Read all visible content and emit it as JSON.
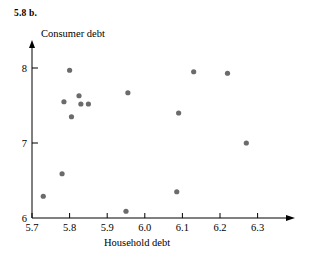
{
  "figure": {
    "exercise_label": "5.8  b.",
    "y_axis_title": "Consumer debt",
    "x_axis_title": "Household debt"
  },
  "chart_data": {
    "type": "scatter",
    "title": "",
    "xlabel": "Household debt",
    "ylabel": "Consumer debt",
    "xlim": [
      5.7,
      6.35
    ],
    "ylim": [
      6.0,
      8.1
    ],
    "xticks": [
      "5.7",
      "5.8",
      "5.9",
      "6.0",
      "6.1",
      "6.2",
      "6.3"
    ],
    "xtick_values": [
      5.7,
      5.8,
      5.9,
      6.0,
      6.1,
      6.2,
      6.3
    ],
    "yticks": [
      "6",
      "7",
      "8"
    ],
    "ytick_values": [
      6,
      7,
      8
    ],
    "grid": false,
    "legend": null,
    "marker_color": "#6b6b6b",
    "axis_color": "#000000",
    "points": [
      {
        "x": 5.73,
        "y": 6.29
      },
      {
        "x": 5.78,
        "y": 6.59
      },
      {
        "x": 5.785,
        "y": 7.55
      },
      {
        "x": 5.8,
        "y": 7.97
      },
      {
        "x": 5.805,
        "y": 7.35
      },
      {
        "x": 5.825,
        "y": 7.63
      },
      {
        "x": 5.83,
        "y": 7.52
      },
      {
        "x": 5.85,
        "y": 7.52
      },
      {
        "x": 5.95,
        "y": 6.09
      },
      {
        "x": 5.955,
        "y": 7.67
      },
      {
        "x": 6.085,
        "y": 6.35
      },
      {
        "x": 6.09,
        "y": 7.4
      },
      {
        "x": 6.13,
        "y": 7.95
      },
      {
        "x": 6.22,
        "y": 7.93
      },
      {
        "x": 6.27,
        "y": 7.0
      }
    ]
  },
  "axes_geometry": {
    "x_pixel_at_5_7": 32,
    "pixels_per_0_1_x": 37.6,
    "y_pixel_at_6": 218,
    "pixels_per_1_y": 75
  }
}
